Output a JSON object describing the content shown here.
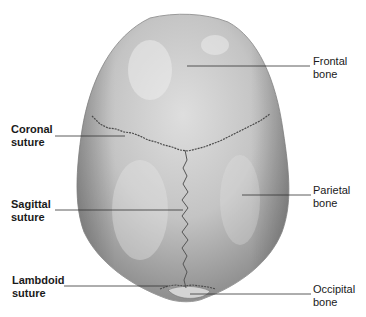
{
  "figure": {
    "colors": {
      "bone": "#b8b8b8",
      "bone_light": "#dcdcdc",
      "bone_dark": "#8c8c8c",
      "suture": "#4a4a4a",
      "leader": "#333333"
    }
  },
  "labels_left": [
    {
      "line1": "Coronal",
      "line2": "suture"
    },
    {
      "line1": "Sagittal",
      "line2": "suture"
    },
    {
      "line1": "Lambdoid",
      "line2": "suture"
    }
  ],
  "labels_right": [
    {
      "line1": "Frontal",
      "line2": "bone"
    },
    {
      "line1": "Parietal",
      "line2": "bone"
    },
    {
      "line1": "Occipital",
      "line2": "bone"
    }
  ]
}
